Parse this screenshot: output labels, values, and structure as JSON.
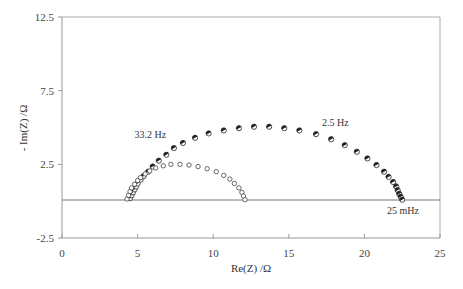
{
  "chart_data": {
    "type": "scatter",
    "title": "",
    "xlabel": "Re(Z) /Ω",
    "ylabel": "- Im(Z) /Ω",
    "xlim": [
      0,
      25
    ],
    "ylim": [
      -2.5,
      12.5
    ],
    "xticks": [
      "0",
      "5",
      "10",
      "15",
      "20",
      "25"
    ],
    "yticks": [
      "12.5",
      "7.5",
      "2.5",
      "-2.5"
    ],
    "grid": false,
    "legend": null,
    "annotations": [
      {
        "text": "33.2 Hz",
        "x": 4.8,
        "y": 4.3
      },
      {
        "text": "2.5 Hz",
        "x": 17.2,
        "y": 5.1
      },
      {
        "text": "25 mHz",
        "x": 21.5,
        "y": -0.9
      }
    ],
    "series": [
      {
        "name": "large-arc",
        "marker": "half-filled circle",
        "x": [
          4.5,
          4.6,
          4.7,
          4.8,
          4.9,
          5.0,
          5.2,
          5.4,
          5.7,
          6.0,
          6.4,
          6.9,
          7.4,
          8.0,
          8.8,
          9.7,
          10.7,
          11.7,
          12.7,
          13.7,
          14.7,
          15.7,
          16.8,
          17.8,
          18.7,
          19.5,
          20.2,
          20.8,
          21.3,
          21.6,
          21.9,
          22.1,
          22.2,
          22.3,
          22.4,
          22.5
        ],
        "y": [
          0.2,
          0.4,
          0.6,
          0.8,
          1.0,
          1.2,
          1.45,
          1.7,
          2.0,
          2.35,
          2.75,
          3.15,
          3.6,
          3.95,
          4.3,
          4.6,
          4.8,
          4.95,
          5.05,
          5.05,
          4.95,
          4.8,
          4.55,
          4.2,
          3.8,
          3.35,
          2.9,
          2.45,
          2.0,
          1.65,
          1.3,
          1.0,
          0.75,
          0.5,
          0.3,
          0.1
        ]
      },
      {
        "name": "small-arc",
        "marker": "diamond-ish open",
        "x": [
          4.3,
          4.4,
          4.5,
          4.6,
          4.8,
          5.0,
          5.2,
          5.5,
          5.8,
          6.2,
          6.7,
          7.2,
          7.8,
          8.4,
          9.0,
          9.6,
          10.2,
          10.7,
          11.1,
          11.4,
          11.7,
          11.9,
          12.0,
          12.1
        ],
        "y": [
          0.15,
          0.4,
          0.65,
          0.9,
          1.15,
          1.4,
          1.6,
          1.85,
          2.05,
          2.25,
          2.4,
          2.5,
          2.5,
          2.45,
          2.35,
          2.2,
          2.0,
          1.75,
          1.5,
          1.2,
          0.9,
          0.6,
          0.35,
          0.1
        ]
      }
    ]
  }
}
